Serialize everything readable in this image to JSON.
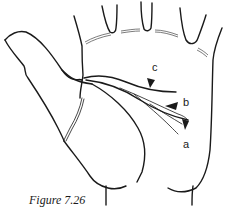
{
  "figure": {
    "caption": "Figure 7.26",
    "labels": {
      "a": "a",
      "b": "b",
      "c": "c"
    },
    "colors": {
      "line": "#1a1a1a",
      "background": "#ffffff"
    }
  }
}
